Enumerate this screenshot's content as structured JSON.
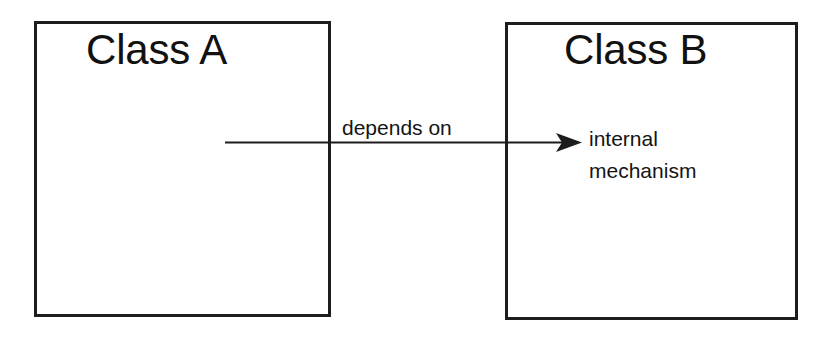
{
  "diagram": {
    "type": "class-dependency",
    "background_color": "#ffffff",
    "stroke_color": "#1d1d1d",
    "text_color": "#111111",
    "nodes": [
      {
        "id": "class-a",
        "label": "Class A",
        "x": 34,
        "y": 21,
        "width": 297,
        "height": 296
      },
      {
        "id": "class-b",
        "label": "Class B",
        "x": 505,
        "y": 22,
        "width": 293,
        "height": 298
      }
    ],
    "edges": [
      {
        "id": "depends-on-edge",
        "from": "class-a",
        "to": "class-b",
        "label": "depends on",
        "target_label": "internal\nmechanism",
        "arrowhead": "filled-triangle",
        "start_x": 225,
        "end_x": 582,
        "y": 142
      }
    ]
  }
}
